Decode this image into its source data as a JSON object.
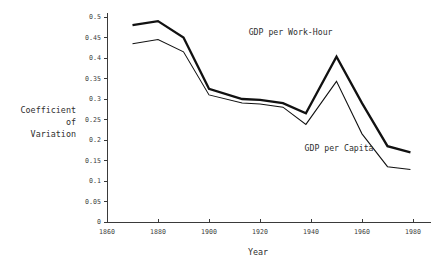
{
  "chart_data": {
    "type": "line",
    "title": "",
    "xlabel": "Year",
    "ylabel": "Coefficient of Variation",
    "xlim": [
      1860,
      1980
    ],
    "ylim": [
      0,
      0.5
    ],
    "grid": false,
    "legend_position": "inline-annotations",
    "x_ticks": [
      "1860",
      "1880",
      "1900",
      "1920",
      "1940",
      "1960",
      "1980"
    ],
    "x_tick_values": [
      1860,
      1880,
      1900,
      1920,
      1940,
      1960,
      1980
    ],
    "y_ticks": [
      "0",
      "0.05",
      "0.1",
      "0.15",
      "0.2",
      "0.25",
      "0.3",
      "0.35",
      "0.4",
      "0.45",
      "0.5"
    ],
    "y_tick_values": [
      0,
      0.05,
      0.1,
      0.15,
      0.2,
      0.25,
      0.3,
      0.35,
      0.4,
      0.45,
      0.5
    ],
    "series": [
      {
        "name": "GDP per Work-Hour",
        "x": [
          1870,
          1880,
          1890,
          1900,
          1913,
          1920,
          1929,
          1938,
          1950,
          1960,
          1970,
          1979
        ],
        "values": [
          0.48,
          0.49,
          0.45,
          0.325,
          0.3,
          0.298,
          0.29,
          0.265,
          0.403,
          0.29,
          0.185,
          0.17
        ],
        "style": "thick",
        "color": "#111111",
        "label_x": 1932,
        "label_y": 0.455
      },
      {
        "name": "GDP per Capita",
        "x": [
          1870,
          1880,
          1890,
          1900,
          1913,
          1920,
          1929,
          1938,
          1950,
          1960,
          1970,
          1979
        ],
        "values": [
          0.435,
          0.445,
          0.415,
          0.31,
          0.29,
          0.288,
          0.28,
          0.238,
          0.343,
          0.215,
          0.135,
          0.128
        ],
        "style": "thin",
        "color": "#111111",
        "label_x": 1951,
        "label_y": 0.172
      }
    ]
  },
  "axes": {
    "y_title_lines": [
      "Coefficient",
      "of",
      "Variation"
    ],
    "x_title": "Year"
  },
  "colors": {
    "axis": "#3a3a3a",
    "text": "#2f2f2f",
    "series": "#111111",
    "background": "#ffffff"
  }
}
